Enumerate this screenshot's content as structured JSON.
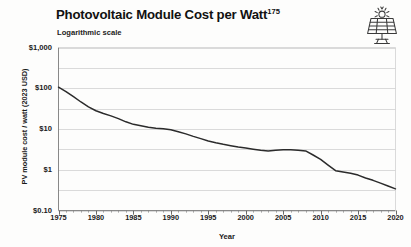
{
  "header": {
    "title": "Photovoltaic Module Cost per Watt",
    "title_superscript": "175",
    "subtitle": "Logarithmic scale",
    "icon": "solar-panel-icon"
  },
  "colors": {
    "line": "#2b2b2b",
    "grid": "#d0d0d0",
    "axis": "#8a8a8a",
    "text": "#1a1a1a",
    "background": "#fdfdfc"
  },
  "chart_data": {
    "type": "line",
    "title": "Photovoltaic Module Cost per Watt",
    "subtitle": "Logarithmic scale",
    "xlabel": "Year",
    "ylabel": "PV module cost / watt (2023 USD)",
    "scale": "log",
    "grid": true,
    "legend": "none",
    "xlim": [
      1975,
      2020
    ],
    "ylim": [
      0.1,
      1000
    ],
    "xticks": [
      1975,
      1980,
      1985,
      1990,
      1995,
      2000,
      2005,
      2010,
      2015,
      2020
    ],
    "xtick_labels": [
      "1975",
      "1980",
      "1985",
      "1990",
      "1995",
      "2000",
      "2005",
      "2010",
      "2015",
      "2020"
    ],
    "xminor_step": 1,
    "yticks": [
      1000,
      100,
      10,
      1,
      0.1
    ],
    "ytick_labels": [
      "$1,000",
      "$100",
      "$10",
      "$1",
      "$0.10"
    ],
    "ygridlines": [
      1000,
      316,
      100,
      31.6,
      10,
      3.16,
      1,
      0.316,
      0.1
    ],
    "series": [
      {
        "name": "PV module cost per watt",
        "x": [
          1975,
          1976,
          1977,
          1978,
          1979,
          1980,
          1981,
          1982,
          1983,
          1984,
          1985,
          1986,
          1987,
          1988,
          1989,
          1990,
          1991,
          1992,
          1993,
          1994,
          1995,
          1996,
          1997,
          1998,
          1999,
          2000,
          2001,
          2002,
          2003,
          2004,
          2005,
          2006,
          2007,
          2008,
          2009,
          2010,
          2011,
          2012,
          2013,
          2014,
          2015,
          2016,
          2017,
          2018,
          2019,
          2020
        ],
        "values": [
          106,
          83,
          62,
          46,
          35,
          28,
          24,
          21,
          18,
          15,
          13,
          12,
          11,
          10.4,
          10.1,
          9.6,
          8.6,
          7.6,
          6.6,
          5.8,
          5.1,
          4.6,
          4.2,
          3.9,
          3.6,
          3.4,
          3.2,
          3.0,
          2.9,
          3.0,
          3.1,
          3.1,
          3.0,
          2.9,
          2.3,
          1.8,
          1.3,
          0.95,
          0.88,
          0.82,
          0.74,
          0.63,
          0.55,
          0.47,
          0.4,
          0.34
        ]
      }
    ]
  }
}
